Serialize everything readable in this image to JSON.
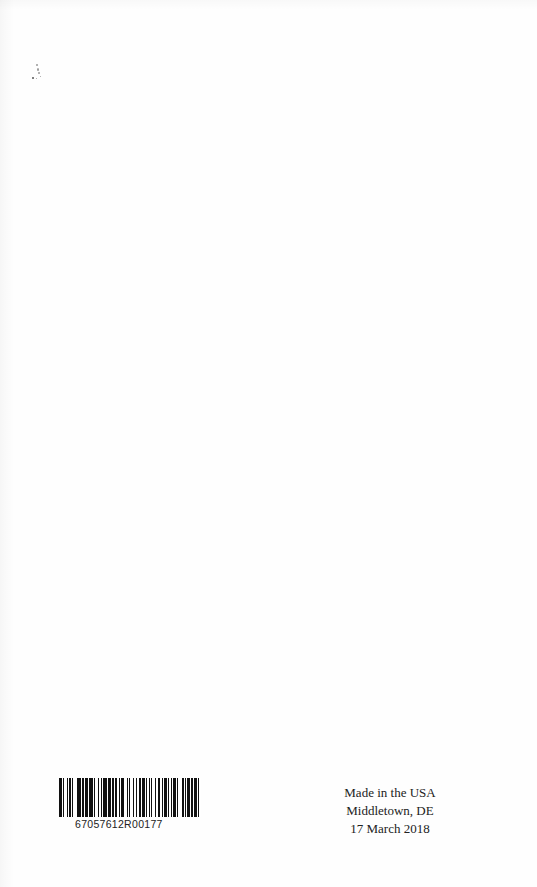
{
  "page": {
    "type": "book-back-page",
    "background": "#fefefe"
  },
  "barcode": {
    "number": "67057612R00177",
    "bar_color": "#111111",
    "pattern": [
      2,
      1,
      1,
      2,
      1,
      1,
      1,
      1,
      1,
      3,
      3,
      1,
      1,
      1,
      2,
      1,
      3,
      1,
      1,
      2,
      1,
      1,
      1,
      1,
      3,
      1,
      2,
      1,
      1,
      1,
      2,
      1,
      1,
      1,
      2,
      2,
      1,
      1,
      1,
      2,
      1,
      1,
      1,
      2,
      1,
      1,
      2,
      1,
      1,
      1,
      1,
      1,
      1,
      2,
      1,
      1,
      2,
      1,
      1,
      1,
      2,
      1,
      1,
      1,
      1,
      1,
      2,
      1,
      1,
      3,
      1,
      1,
      1,
      1,
      2,
      1,
      1,
      1,
      2,
      1,
      1,
      1
    ]
  },
  "imprint": {
    "line1": "Made in the USA",
    "line2": "Middletown, DE",
    "line3": "17 March 2018"
  }
}
